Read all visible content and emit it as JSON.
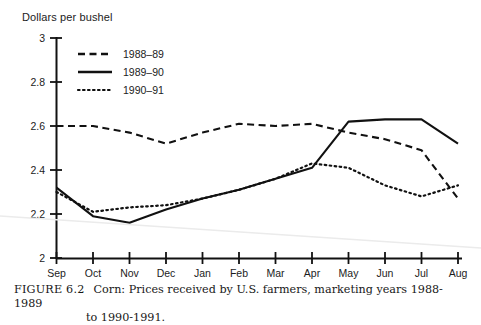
{
  "figure": {
    "caption_label": "FIGURE 6.2",
    "caption_text": "Corn:  Prices received by U.S. farmers, marketing years 1988-1989",
    "caption_line2": "to 1990-1991."
  },
  "chart_data": {
    "type": "line",
    "title": "",
    "ylabel": "Dollars per bushel",
    "xlabel": "",
    "ylim": [
      2,
      3
    ],
    "yticks": [
      2,
      2.2,
      2.4,
      2.6,
      2.8,
      3
    ],
    "ytick_labels": [
      "2",
      "2.2",
      "2.4",
      "2.6",
      "2.8",
      "3"
    ],
    "grid": false,
    "legend_position": "upper-left",
    "categories": [
      "Sep",
      "Oct",
      "Nov",
      "Dec",
      "Jan",
      "Feb",
      "Mar",
      "Apr",
      "May",
      "Jun",
      "Jul",
      "Aug"
    ],
    "series": [
      {
        "name": "1988–89",
        "style": "dashed",
        "color": "#111111",
        "values": [
          2.6,
          2.6,
          2.57,
          2.52,
          2.57,
          2.61,
          2.6,
          2.61,
          2.57,
          2.54,
          2.49,
          2.27
        ]
      },
      {
        "name": "1989–90",
        "style": "solid",
        "color": "#111111",
        "values": [
          2.32,
          2.19,
          2.16,
          2.22,
          2.27,
          2.31,
          2.36,
          2.41,
          2.62,
          2.63,
          2.63,
          2.52
        ]
      },
      {
        "name": "1990–91",
        "style": "dotted",
        "color": "#111111",
        "values": [
          2.3,
          2.21,
          2.23,
          2.24,
          2.27,
          2.31,
          2.36,
          2.43,
          2.41,
          2.33,
          2.28,
          2.33
        ]
      }
    ]
  }
}
